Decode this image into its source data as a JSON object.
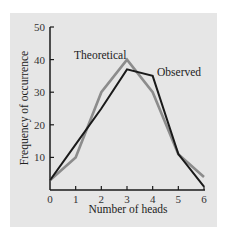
{
  "chart_data": {
    "type": "line",
    "title": "",
    "xlabel": "Number of heads",
    "ylabel": "Frequency of occurrence",
    "x": [
      0,
      1,
      2,
      3,
      4,
      5,
      6
    ],
    "xlim": [
      0,
      6
    ],
    "ylim": [
      0,
      50
    ],
    "xticks": [
      "0",
      "1",
      "2",
      "3",
      "4",
      "5",
      "6"
    ],
    "yticks": [
      "10",
      "20",
      "30",
      "40",
      "50"
    ],
    "grid": false,
    "legend": "inline labels",
    "series": [
      {
        "name": "Theoretical",
        "color": "#8c8c8c",
        "values": [
          3,
          10,
          30,
          40,
          30,
          11,
          4
        ]
      },
      {
        "name": "Observed",
        "color": "#1a1a1a",
        "values": [
          3,
          14,
          25,
          37,
          35,
          11,
          1
        ]
      }
    ]
  }
}
